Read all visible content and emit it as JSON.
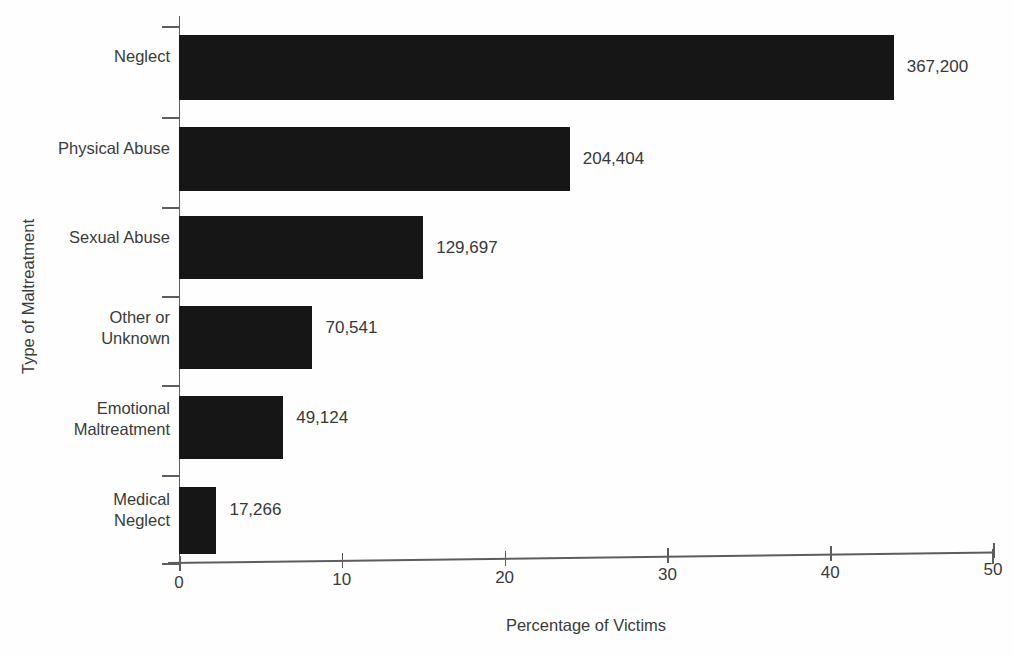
{
  "caption_remnant": "",
  "chart_data": {
    "type": "bar",
    "orientation": "horizontal",
    "title": "",
    "xlabel": "Percentage of Victims",
    "ylabel": "Type of Maltreatment",
    "xlim": [
      0,
      50
    ],
    "xticks": [
      0,
      10,
      20,
      30,
      40,
      50
    ],
    "xtick_labels": [
      "0",
      "10",
      "20",
      "30",
      "40",
      "50"
    ],
    "grid": false,
    "legend": null,
    "bar_color": "#161616",
    "axis_color": "#5d5d5d",
    "text_color": "#3b3b3b",
    "categories": [
      "Neglect",
      "Physical Abuse",
      "Sexual Abuse",
      "Other or\nUnknown",
      "Emotional\nMaltreatment",
      "Medical\nNeglect"
    ],
    "values": [
      43.9,
      24.0,
      15.0,
      8.2,
      6.4,
      2.3
    ],
    "data_labels": [
      "367,200",
      "204,404",
      "129,697",
      "70,541",
      "49,124",
      "17,266"
    ],
    "counts": [
      367200,
      204404,
      129697,
      70541,
      49124,
      17266
    ]
  },
  "geometry": {
    "axis_x0": 179,
    "axis_x50": 993,
    "px_per_unit": 16.28,
    "bars": [
      {
        "top": 35,
        "height": 65,
        "label_y": 57,
        "tick_y": 117
      },
      {
        "top": 127,
        "height": 64,
        "label_y": 149,
        "tick_y": 207
      },
      {
        "top": 216,
        "height": 63,
        "label_y": 238,
        "tick_y": 296
      },
      {
        "top": 306,
        "height": 63,
        "label_y": 318,
        "tick_y": 385
      },
      {
        "top": 396,
        "height": 63,
        "label_y": 408,
        "tick_y": 475
      },
      {
        "top": 487,
        "height": 67,
        "label_y": 500,
        "tick_y": 563
      }
    ],
    "label_offsets_y": [
      46,
      138,
      227,
      317,
      408,
      499
    ],
    "value_label_gap": 13
  }
}
